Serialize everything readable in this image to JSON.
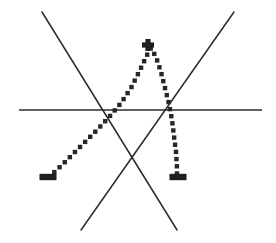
{
  "figure": {
    "title": "",
    "canvas": {
      "width": 276,
      "height": 243,
      "background": "#ffffff"
    },
    "ink_color": "#2b2b2b",
    "dot_color": "#262626",
    "marker_color": "#1f1f1f"
  },
  "chart_data": {
    "type": "line",
    "title": "",
    "xlabel": "",
    "ylabel": "",
    "grid": false,
    "legend": null,
    "axis": {
      "name": "horizontal-axis",
      "style": "solid",
      "x_start": 19,
      "x_end": 262,
      "y": 110
    },
    "series": [
      {
        "name": "descending-line",
        "style": "solid",
        "points": [
          [
            42,
            12
          ],
          [
            177,
            230
          ]
        ]
      },
      {
        "name": "ascending-line",
        "style": "solid",
        "points": [
          [
            81,
            230
          ],
          [
            234,
            12
          ]
        ]
      },
      {
        "name": "dotted-curve",
        "style": "dotted",
        "points": [
          [
            49,
            177
          ],
          [
            62,
            165
          ],
          [
            74,
            153
          ],
          [
            86,
            141
          ],
          [
            98,
            129
          ],
          [
            110,
            116
          ],
          [
            121,
            103
          ],
          [
            131,
            88
          ],
          [
            140,
            70
          ],
          [
            147,
            55
          ],
          [
            151,
            48
          ],
          [
            156,
            57
          ],
          [
            161,
            72
          ],
          [
            165,
            88
          ],
          [
            169,
            104
          ],
          [
            172,
            120
          ],
          [
            174,
            136
          ],
          [
            176,
            152
          ],
          [
            177,
            168
          ],
          [
            177,
            176
          ]
        ]
      }
    ],
    "markers": [
      {
        "name": "peak-plus-marker",
        "symbol": "+",
        "x": 148,
        "y": 45
      },
      {
        "name": "left-minus-marker",
        "symbol": "-",
        "x": 48,
        "y": 177
      },
      {
        "name": "right-minus-marker",
        "symbol": "-",
        "x": 178,
        "y": 177
      }
    ],
    "annotations": []
  }
}
